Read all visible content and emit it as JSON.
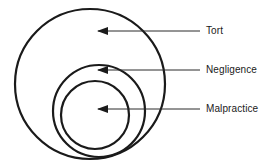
{
  "diagram": {
    "type": "nested-circles",
    "title": "",
    "background_color": "#ffffff",
    "stroke_color": "#1a1a1a",
    "canvas": {
      "width": 277,
      "height": 166
    },
    "circles": [
      {
        "id": "tort",
        "label": "Tort",
        "cx": 90,
        "cy": 84,
        "r": 75,
        "stroke_width": 2.2,
        "level": 1
      },
      {
        "id": "negligence",
        "label": "Negligence",
        "cx": 99,
        "cy": 111,
        "r": 46,
        "stroke_width": 2.2,
        "level": 2
      },
      {
        "id": "malpractice",
        "label": "Malpractice",
        "cx": 95,
        "cy": 115,
        "r": 34,
        "stroke_width": 2.2,
        "level": 3
      }
    ],
    "callouts": [
      {
        "id": "callout-tort",
        "label": "Tort",
        "line_y": 31,
        "line_x_start": 98,
        "line_x_end": 200,
        "arrow_tip_x": 97,
        "arrow_direction": "left"
      },
      {
        "id": "callout-negligence",
        "label": "Negligence",
        "line_y": 70,
        "line_x_start": 98,
        "line_x_end": 200,
        "arrow_tip_x": 97,
        "arrow_direction": "left"
      },
      {
        "id": "callout-malpractice",
        "label": "Malpractice",
        "line_y": 109,
        "line_x_start": 98,
        "line_x_end": 200,
        "arrow_tip_x": 97,
        "arrow_direction": "left"
      }
    ]
  }
}
